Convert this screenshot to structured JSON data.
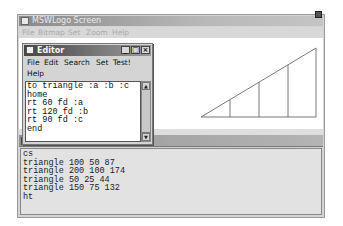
{
  "main_window": {
    "title": "MSWLogo Screen",
    "menu": [
      "File",
      "Bitmap",
      "Set",
      "Zoom",
      "Help"
    ]
  },
  "editor": {
    "title": "Editor",
    "menu": [
      "File",
      "Edit",
      "Search",
      "Set",
      "Test!",
      "Help"
    ],
    "window_buttons": {
      "minimize": "_",
      "maximize": "□",
      "close": "×"
    },
    "lines": [
      "to triangle :a :b :c",
      "home",
      "rt 60 fd :a",
      "rt 120 fd :b",
      "rt 90 fd :c",
      "end"
    ],
    "scrollbar": {
      "up": "▲",
      "down": "▼"
    }
  },
  "commander": {
    "lines": [
      "cs",
      "triangle 100 50 87",
      "triangle 200 100 174",
      "triangle 50 25 44",
      "triangle 150 75 132",
      "ht"
    ]
  },
  "canvas": {
    "drawing": "nested right triangles sharing origin",
    "stroke_color": "#555555"
  }
}
